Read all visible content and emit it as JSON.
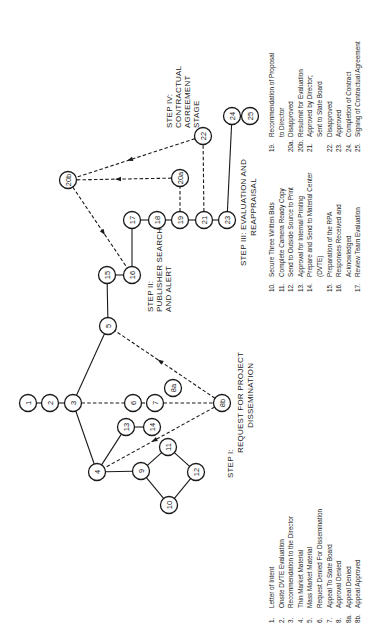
{
  "diagram": {
    "orientation": "rotated -90deg",
    "nodes": [
      {
        "id": "1",
        "x": 28,
        "y": 403
      },
      {
        "id": "2",
        "x": 50,
        "y": 403
      },
      {
        "id": "3",
        "x": 73,
        "y": 403
      },
      {
        "id": "4",
        "x": 97,
        "y": 472
      },
      {
        "id": "5",
        "x": 108,
        "y": 326
      },
      {
        "id": "6",
        "x": 133,
        "y": 403
      },
      {
        "id": "7",
        "x": 155,
        "y": 403
      },
      {
        "id": "8a",
        "x": 173,
        "y": 388
      },
      {
        "id": "8b",
        "x": 222,
        "y": 403
      },
      {
        "id": "9",
        "x": 141,
        "y": 471
      },
      {
        "id": "10",
        "x": 169,
        "y": 505
      },
      {
        "id": "11",
        "x": 168,
        "y": 447
      },
      {
        "id": "12",
        "x": 196,
        "y": 472
      },
      {
        "id": "13",
        "x": 126,
        "y": 427
      },
      {
        "id": "14",
        "x": 152,
        "y": 427
      },
      {
        "id": "15",
        "x": 107,
        "y": 275
      },
      {
        "id": "16",
        "x": 132,
        "y": 275
      },
      {
        "id": "17",
        "x": 132,
        "y": 220
      },
      {
        "id": "18",
        "x": 157,
        "y": 220
      },
      {
        "id": "19",
        "x": 180,
        "y": 220
      },
      {
        "id": "20a",
        "x": 180,
        "y": 178
      },
      {
        "id": "20b",
        "x": 68,
        "y": 180
      },
      {
        "id": "21",
        "x": 204,
        "y": 220
      },
      {
        "id": "22",
        "x": 203,
        "y": 136
      },
      {
        "id": "23",
        "x": 227,
        "y": 220
      },
      {
        "id": "24",
        "x": 232,
        "y": 116
      },
      {
        "id": "25",
        "x": 250,
        "y": 116
      }
    ],
    "edges": [
      {
        "from": "1",
        "to": "2",
        "style": "solid"
      },
      {
        "from": "2",
        "to": "3",
        "style": "solid"
      },
      {
        "from": "3",
        "to": "5",
        "style": "solid"
      },
      {
        "from": "3",
        "to": "4",
        "style": "solid"
      },
      {
        "from": "3",
        "to": "6",
        "style": "dashed"
      },
      {
        "from": "6",
        "to": "7",
        "style": "dashed"
      },
      {
        "from": "7",
        "to": "8b",
        "style": "dashed"
      },
      {
        "from": "4",
        "to": "13",
        "style": "solid"
      },
      {
        "from": "13",
        "to": "14",
        "style": "solid"
      },
      {
        "from": "4",
        "to": "9",
        "style": "solid"
      },
      {
        "from": "9",
        "to": "11",
        "style": "solid"
      },
      {
        "from": "9",
        "to": "10",
        "style": "solid"
      },
      {
        "from": "11",
        "to": "12",
        "style": "solid"
      },
      {
        "from": "10",
        "to": "12",
        "style": "solid"
      },
      {
        "from": "8b",
        "to": "4",
        "style": "dashed",
        "arrow": true
      },
      {
        "from": "8b",
        "to": "5",
        "style": "dashed",
        "arrow": true
      },
      {
        "from": "5",
        "to": "15",
        "style": "solid"
      },
      {
        "from": "15",
        "to": "16",
        "style": "solid"
      },
      {
        "from": "16",
        "to": "17",
        "style": "solid"
      },
      {
        "from": "17",
        "to": "18",
        "style": "solid"
      },
      {
        "from": "18",
        "to": "19",
        "style": "solid"
      },
      {
        "from": "19",
        "to": "21",
        "style": "solid"
      },
      {
        "from": "21",
        "to": "23",
        "style": "solid"
      },
      {
        "from": "19",
        "to": "20a",
        "style": "dashed"
      },
      {
        "from": "21",
        "to": "22",
        "style": "dashed"
      },
      {
        "from": "23",
        "to": "24",
        "style": "solid"
      },
      {
        "from": "24",
        "to": "25",
        "style": "solid"
      },
      {
        "from": "20a",
        "to": "20b",
        "style": "dashed",
        "arrow": true
      },
      {
        "from": "22",
        "to": "20b",
        "style": "dashed",
        "arrow": true
      },
      {
        "from": "20b",
        "to": "16",
        "style": "dashed",
        "arrow": true
      }
    ],
    "steps": [
      {
        "id": "step1",
        "lines": [
          "STEP I:",
          "REQUEST FOR PROJECT",
          "DISSEMINATION"
        ]
      },
      {
        "id": "step2",
        "lines": [
          "STEP II:",
          "PUBLISHER SEARCH",
          "AND ALERT"
        ]
      },
      {
        "id": "step3",
        "lines": [
          "STEP III: EVALUATION AND",
          "REAPPRAISAL"
        ]
      },
      {
        "id": "step4",
        "lines": [
          "STEP IV:",
          "CONTRACTUAL",
          "AGREEMENT",
          "STAGE"
        ]
      }
    ]
  },
  "legend": {
    "column1": [
      {
        "num": "1.",
        "text": "Letter of Intent"
      },
      {
        "num": "2.",
        "text": "Onsite DVTE Evaluation"
      },
      {
        "num": "3.",
        "text": "Recommendation to the Director"
      },
      {
        "num": "4.",
        "text": "Thin Market Material"
      },
      {
        "num": "5.",
        "text": "Mass Market Material"
      },
      {
        "num": "6.",
        "text": "Request Denied For Dissemination"
      },
      {
        "num": "7.",
        "text": "Appeal To State Board"
      },
      {
        "num": "8.",
        "text": "Approval Denied"
      },
      {
        "num": "8a.",
        "text": "Appeal Denied"
      },
      {
        "num": "8b.",
        "text": "Appeal Approved"
      }
    ],
    "column2": [
      {
        "num": "10.",
        "text": "Secure Three Written Bids"
      },
      {
        "num": "11.",
        "text": "Complete Camera Ready Copy"
      },
      {
        "num": "12.",
        "text": "Send to Outside Source to Print"
      },
      {
        "num": "13.",
        "text": "Approval for Internal Printing"
      },
      {
        "num": "14.",
        "text": "Prepare and Send to Material Center"
      },
      {
        "num": "",
        "text": "(DVTE)"
      },
      {
        "num": "15.",
        "text": "Preparation of the RPA"
      },
      {
        "num": "16.",
        "text": "Responses Received and"
      },
      {
        "num": "",
        "text": "Acknowledged"
      },
      {
        "num": "17.",
        "text": "Review Team Evaluation"
      }
    ],
    "column3": [
      {
        "num": "19.",
        "text": "Recommendation of Proposal"
      },
      {
        "num": "",
        "text": "to Director"
      },
      {
        "num": "20a.",
        "text": "Disapproved"
      },
      {
        "num": "20b.",
        "text": "Resubmit for Evaluation"
      },
      {
        "num": "21.",
        "text": "Approved by Director;"
      },
      {
        "num": "",
        "text": "Sent to State Board"
      },
      {
        "num": "22.",
        "text": "Disapproved"
      },
      {
        "num": "23.",
        "text": "Approved"
      },
      {
        "num": "24.",
        "text": "Completion of Contract"
      },
      {
        "num": "25.",
        "text": "Signing of Contractual Agreement"
      }
    ]
  }
}
